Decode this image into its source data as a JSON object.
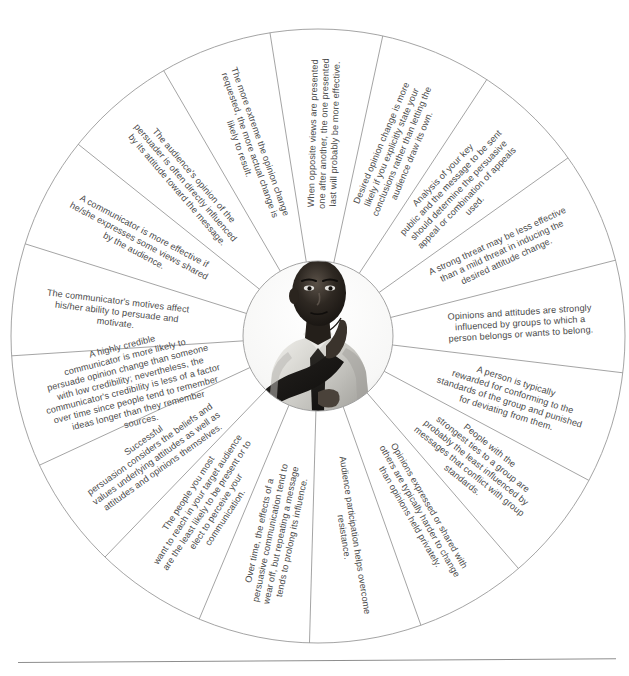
{
  "figure": {
    "center": {
      "photo_alt": "Man in light dress shirt and dark tie in a thinking pose with hand on chin",
      "photo_name": "thinking-man-photo"
    },
    "geometry": {
      "cx": 318,
      "cy": 336,
      "outer_radius": 307,
      "inner_radius": 75,
      "start_angle_deg": -99,
      "sweep_total_deg": 360
    },
    "colors": {
      "line": "#9a9a9a",
      "text": "#4a4a4a",
      "face": "#ffffff",
      "rule": "#8e8e8e"
    },
    "segments": [
      {
        "id": "opposite-views",
        "lines": [
          "When opposite views are presented",
          "one after another, the one presented",
          "last will probably be more effective."
        ]
      },
      {
        "id": "desired-opinion-change",
        "lines": [
          "Desired opinion change is more",
          "likely if you explicitly state your",
          "conclusions rather than letting the",
          "audience draw its own."
        ]
      },
      {
        "id": "analysis-of-key-public",
        "lines": [
          "Analysis of your key",
          "public and the message to be sent",
          "should determine the persuasive",
          "appeal or combination of appeals",
          "used."
        ]
      },
      {
        "id": "strong-threat",
        "lines": [
          "A strong threat may be less effective",
          "than a mild threat in inducing the",
          "desired attitude change."
        ]
      },
      {
        "id": "opinions-influenced-by-groups",
        "lines": [
          "Opinions and attitudes are strongly",
          "influenced by groups to which a",
          "person belongs or wants to belong."
        ]
      },
      {
        "id": "rewarded-for-conforming",
        "lines": [
          "A person is typically",
          "rewarded for conforming to the",
          "standards of the group and punished",
          "for deviating from them."
        ]
      },
      {
        "id": "strongest-ties-to-group",
        "lines": [
          "People with the",
          "strongest ties to a group are",
          "probably the least influenced by",
          "messages that conflict with group",
          "standards."
        ]
      },
      {
        "id": "opinions-expressed-or-shared",
        "lines": [
          "Opinions expressed or shared with",
          "others are typically harder to change",
          "than opinions held privately."
        ]
      },
      {
        "id": "audience-participation",
        "lines": [
          "Audience participation helps overcome",
          "resistance."
        ]
      },
      {
        "id": "effects-wear-off-over-time",
        "lines": [
          "Over time, the effects of a",
          "persuasive communication tend to",
          "wear off, but repeating a message",
          "tends to prolong its influence."
        ]
      },
      {
        "id": "people-you-most-want-to-reach",
        "lines": [
          "The people you most",
          "want to reach in your target audience",
          "are the least likely to be present or to",
          "elect to perceive your",
          "communication."
        ]
      },
      {
        "id": "successful-persuasion-values",
        "lines": [
          "Successful",
          "persuasion considers the beliefs and",
          "values underlying attitudes as well as",
          "attitudes and opinions themselves."
        ]
      },
      {
        "id": "highly-credible-communicator",
        "lines": [
          "A highly credible",
          "communicator is more likely to",
          "persuade opinion change than someone",
          "with low credibility; nevertheless, the",
          "communicator's credibility is less of a factor",
          "over time since people tend to remember",
          "ideas longer than they remember",
          "sources."
        ]
      },
      {
        "id": "communicator-motives",
        "lines": [
          "The communicator's motives affect",
          "his/her ability to persuade and",
          "motivate."
        ]
      },
      {
        "id": "communicator-shares-views",
        "lines": [
          "A communicator is more effective if",
          "he/she expresses some views shared",
          "by the audience."
        ]
      },
      {
        "id": "audience-opinion-of-persuader",
        "lines": [
          "The audience's opinion of the",
          "persuader is often directly influenced",
          "by its attitude toward the message."
        ]
      },
      {
        "id": "more-extreme-opinion-change",
        "lines": [
          "The more extreme the opinion change",
          "requested, the more actual change is",
          "likely to result."
        ]
      }
    ]
  }
}
